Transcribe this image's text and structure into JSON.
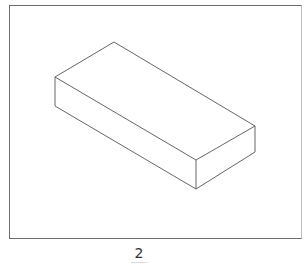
{
  "figure": {
    "label": "2",
    "colors": {
      "frame": "#6e6e6e",
      "line": "#555555",
      "background": "#ffffff"
    },
    "box": {
      "vertices": {
        "top_back": [
          114,
          42
        ],
        "top_left": [
          55,
          77
        ],
        "top_right": [
          255,
          126
        ],
        "top_front": [
          196,
          160
        ],
        "bottom_left": [
          55,
          106
        ],
        "bottom_right": [
          255,
          152
        ],
        "bottom_front": [
          196,
          189
        ]
      }
    }
  }
}
